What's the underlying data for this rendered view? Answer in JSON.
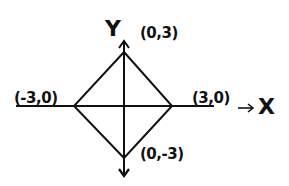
{
  "diagram": {
    "type": "coordinate-sketch",
    "axes": {
      "x_label": "X",
      "y_label": "Y",
      "x_arrow": "→"
    },
    "vertices": [
      {
        "id": "top",
        "label": "(0,3)",
        "x": 0,
        "y": 3
      },
      {
        "id": "right",
        "label": "(3,0)",
        "x": 3,
        "y": 0
      },
      {
        "id": "bottom",
        "label": "(0,-3)",
        "x": 0,
        "y": -3
      },
      {
        "id": "left",
        "label": "(-3,0)",
        "x": -3,
        "y": 0
      }
    ],
    "colors": {
      "ink": "#111111",
      "background": "#ffffff"
    }
  }
}
